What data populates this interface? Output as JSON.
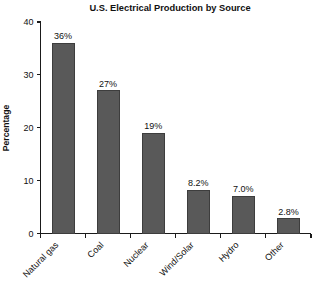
{
  "chart_data": {
    "type": "bar",
    "title": "U.S. Electrical Production by Source",
    "xlabel": "",
    "ylabel": "Percentage",
    "categories": [
      "Natural gas",
      "Coal",
      "Nuclear",
      "Wind/Solar",
      "Hydro",
      "Other"
    ],
    "values": [
      36,
      27,
      19,
      8.2,
      7.0,
      2.8
    ],
    "data_labels": [
      "36%",
      "27%",
      "19%",
      "8.2%",
      "7.0%",
      "2.8%"
    ],
    "ylim": [
      0,
      40
    ],
    "yticks": [
      0,
      10,
      20,
      30,
      40
    ],
    "ytick_labels": [
      "0",
      "10",
      "20",
      "30",
      "40"
    ],
    "grid": false,
    "legend": false,
    "legend_position": "none",
    "bar_color": "#595959",
    "bar_edge_color": "#3d3d3d",
    "axis_color": "#1a1a1a",
    "background_color": "#ffffff",
    "category_label_rotation": -45
  }
}
